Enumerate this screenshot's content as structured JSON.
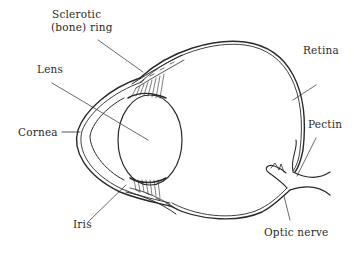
{
  "diagram": {
    "labels": {
      "sclerotic_line1": "Sclerotic",
      "sclerotic_line2": "(bone) ring",
      "lens": "Lens",
      "cornea": "Cornea",
      "iris": "Iris",
      "retina": "Retina",
      "pectin": "Pectin",
      "optic_nerve": "Optic nerve"
    },
    "colors": {
      "stroke": "#2a2a2a",
      "background": "#ffffff"
    }
  }
}
